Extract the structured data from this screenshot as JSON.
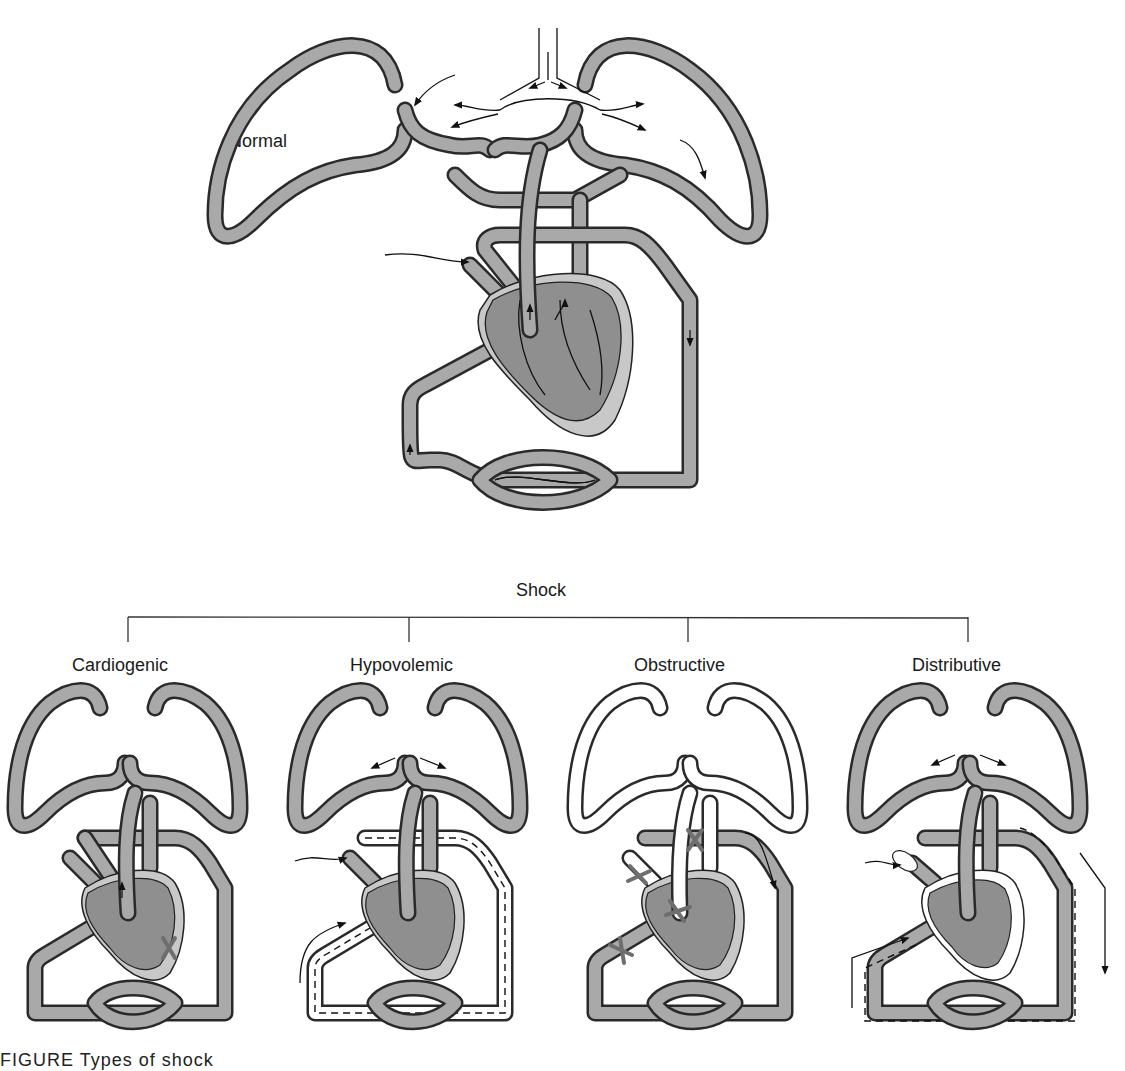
{
  "figure": {
    "top_label": "Normal",
    "tree_root": "Shock",
    "categories": [
      {
        "label": "Cardiogenic",
        "note": "pump failure marked with X on left ventricle"
      },
      {
        "label": "Hypovolemic",
        "note": "reduced volume shown with dashed lines in vessels"
      },
      {
        "label": "Obstructive",
        "note": "X marks on great vessels and heart inflow/outflow"
      },
      {
        "label": "Distributive",
        "note": "dilated vessels with dashed outer flow lines"
      }
    ],
    "caption": "FIGURE  Types of shock"
  },
  "colors": {
    "vessel_fill": "#a9a9a9",
    "vessel_outline": "#2a2a2a",
    "heart_fill": "#8f8f8f",
    "heart_wall": "#c8c8c8",
    "x_mark": "#6e6e6e",
    "background": "#ffffff"
  }
}
